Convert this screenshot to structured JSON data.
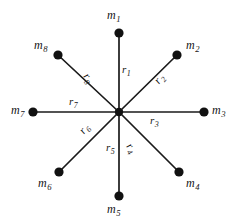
{
  "figure": {
    "background_color": "#ffffff",
    "line_color": "#1a1a1a",
    "node_color": "#111111",
    "center": {
      "x": 119,
      "y": 112
    }
  },
  "masses": [
    {
      "id": "m1",
      "base": "m",
      "sub": "1",
      "node": {
        "x": 119,
        "y": 33
      },
      "label": {
        "x": 107,
        "y": 9
      }
    },
    {
      "id": "m2",
      "base": "m",
      "sub": "2",
      "node": {
        "x": 177,
        "y": 55
      },
      "label": {
        "x": 186,
        "y": 39
      }
    },
    {
      "id": "m3",
      "base": "m",
      "sub": "3",
      "node": {
        "x": 204,
        "y": 112
      },
      "label": {
        "x": 212,
        "y": 104
      }
    },
    {
      "id": "m4",
      "base": "m",
      "sub": "4",
      "node": {
        "x": 179,
        "y": 172
      },
      "label": {
        "x": 186,
        "y": 177
      }
    },
    {
      "id": "m5",
      "base": "m",
      "sub": "5",
      "node": {
        "x": 119,
        "y": 196
      },
      "label": {
        "x": 107,
        "y": 203
      }
    },
    {
      "id": "m6",
      "base": "m",
      "sub": "6",
      "node": {
        "x": 59,
        "y": 172
      },
      "label": {
        "x": 38,
        "y": 177
      }
    },
    {
      "id": "m7",
      "base": "m",
      "sub": "7",
      "node": {
        "x": 33,
        "y": 112
      },
      "label": {
        "x": 11,
        "y": 104
      }
    },
    {
      "id": "m8",
      "base": "m",
      "sub": "8",
      "node": {
        "x": 58,
        "y": 55
      },
      "label": {
        "x": 34,
        "y": 39
      }
    }
  ],
  "radii": [
    {
      "id": "r1",
      "base": "r",
      "sub": "1",
      "label": {
        "x": 122,
        "y": 64
      },
      "rotation_class": ""
    },
    {
      "id": "r2",
      "base": "r",
      "sub": "2",
      "label": {
        "x": 152,
        "y": 79
      },
      "rotation_class": "rot-r2"
    },
    {
      "id": "r3",
      "base": "r",
      "sub": "3",
      "label": {
        "x": 150,
        "y": 115
      },
      "rotation_class": ""
    },
    {
      "id": "r4",
      "base": "r",
      "sub": "4",
      "label": {
        "x": 133,
        "y": 141
      },
      "rotation_class": "rot-r4"
    },
    {
      "id": "r5",
      "base": "r",
      "sub": "5",
      "label": {
        "x": 106,
        "y": 142
      },
      "rotation_class": ""
    },
    {
      "id": "r6",
      "base": "r",
      "sub": "6",
      "label": {
        "x": 77,
        "y": 129
      },
      "rotation_class": "rot-r6"
    },
    {
      "id": "r7",
      "base": "r",
      "sub": "7",
      "label": {
        "x": 69,
        "y": 96
      },
      "rotation_class": ""
    },
    {
      "id": "r8",
      "base": "r",
      "sub": "8",
      "label": {
        "x": 90,
        "y": 71
      },
      "rotation_class": "rot-r8"
    }
  ],
  "geometry": {
    "node_radius": 4.6,
    "hub_radius": 4.2,
    "spoke_width": 1.7
  }
}
